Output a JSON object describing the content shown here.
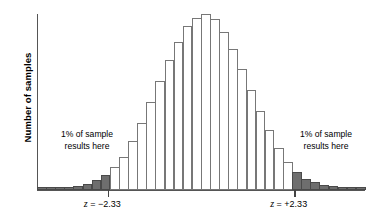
{
  "chart": {
    "ylabel": "Number of samples",
    "xlabel": "",
    "title": ""
  },
  "annotations": {
    "left": {
      "line1": "1% of sample",
      "line2": "results here"
    },
    "right": {
      "line1": "1% of sample",
      "line2": "results here"
    }
  },
  "ticks": {
    "left": {
      "var": "z",
      "eq": " = ",
      "value": "−2.33"
    },
    "right": {
      "var": "z",
      "eq": " = ",
      "value": "+2.33"
    }
  },
  "colors": {
    "bar_fill": "#ffffff",
    "bar_stroke": "#777777",
    "shaded_fill": "#6e6e6e",
    "shaded_stroke": "#4a4a4a",
    "axis": "#555555",
    "text": "#000000"
  },
  "chart_data": {
    "type": "bar",
    "title": "",
    "xlabel": "",
    "ylabel": "Number of samples",
    "grid": false,
    "legend": null,
    "ylim": [
      0,
      100
    ],
    "xlim": [
      -4.1,
      4.1
    ],
    "bin_width_z": 0.228,
    "x_tick_labels": [
      "z = −2.33",
      "z = +2.33"
    ],
    "x_tick_values": [
      -2.33,
      2.33
    ],
    "shaded_regions": [
      {
        "from": -4.1,
        "to": -2.33,
        "label": "1% of sample results here",
        "fill": "#6e6e6e"
      },
      {
        "from": 2.33,
        "to": 4.1,
        "label": "1% of sample results here",
        "fill": "#6e6e6e"
      }
    ],
    "categories": [
      "-4.10",
      "-3.87",
      "-3.64",
      "-3.42",
      "-3.19",
      "-2.96",
      "-2.73",
      "-2.50",
      "-2.28",
      "-2.05",
      "-1.82",
      "-1.59",
      "-1.37",
      "-1.14",
      "-0.91",
      "-0.68",
      "-0.46",
      "-0.23",
      "0.00",
      "0.23",
      "0.46",
      "0.68",
      "0.91",
      "1.14",
      "1.37",
      "1.59",
      "1.82",
      "2.05",
      "2.28",
      "2.50",
      "2.73",
      "2.96",
      "3.19",
      "3.42",
      "3.64",
      "3.87"
    ],
    "values": [
      1.5,
      1.5,
      1.5,
      1.5,
      2.5,
      3.5,
      5.5,
      8.5,
      13.0,
      19.0,
      28.0,
      38.0,
      50.0,
      62.0,
      74.0,
      84.0,
      93.0,
      98.0,
      100.0,
      97.0,
      90.0,
      80.0,
      69.0,
      57.0,
      45.0,
      34.0,
      24.0,
      16.0,
      10.0,
      6.5,
      4.5,
      3.0,
      2.0,
      1.5,
      1.5,
      1.5
    ],
    "shaded_flags": [
      true,
      true,
      true,
      true,
      true,
      true,
      true,
      true,
      false,
      false,
      false,
      false,
      false,
      false,
      false,
      false,
      false,
      false,
      false,
      false,
      false,
      false,
      false,
      false,
      false,
      false,
      false,
      false,
      true,
      true,
      true,
      true,
      true,
      true,
      true,
      true
    ]
  }
}
